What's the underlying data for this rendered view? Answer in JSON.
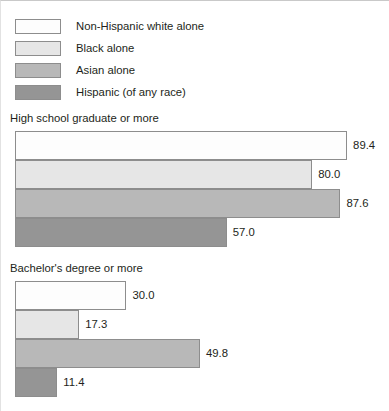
{
  "legend": {
    "items": [
      {
        "label": "Non-Hispanic white alone",
        "color": "#fdfdfd"
      },
      {
        "label": "Black alone",
        "color": "#e6e6e6"
      },
      {
        "label": "Asian alone",
        "color": "#b8b8b8"
      },
      {
        "label": "Hispanic (of any race)",
        "color": "#959595"
      }
    ]
  },
  "chart_data": [
    {
      "type": "bar",
      "orientation": "horizontal",
      "title": "High school graduate or more",
      "categories": [
        "Non-Hispanic white alone",
        "Black alone",
        "Asian alone",
        "Hispanic (of any race)"
      ],
      "values": [
        89.4,
        80.0,
        87.6,
        57.0
      ],
      "value_labels": [
        "89.4",
        "80.0",
        "87.6",
        "57.0"
      ],
      "colors": [
        "#fdfdfd",
        "#e6e6e6",
        "#b8b8b8",
        "#959595"
      ],
      "xlabel": "",
      "ylabel": "",
      "xlim": [
        0,
        100
      ],
      "grid": false,
      "legend_position": "top"
    },
    {
      "type": "bar",
      "orientation": "horizontal",
      "title": "Bachelor's degree or more",
      "categories": [
        "Non-Hispanic white alone",
        "Black alone",
        "Asian alone",
        "Hispanic (of any race)"
      ],
      "values": [
        30.0,
        17.3,
        49.8,
        11.4
      ],
      "value_labels": [
        "30.0",
        "17.3",
        "49.8",
        "11.4"
      ],
      "colors": [
        "#fdfdfd",
        "#e6e6e6",
        "#b8b8b8",
        "#959595"
      ],
      "xlabel": "",
      "ylabel": "",
      "xlim": [
        0,
        100
      ],
      "grid": false,
      "legend_position": "top"
    }
  ]
}
